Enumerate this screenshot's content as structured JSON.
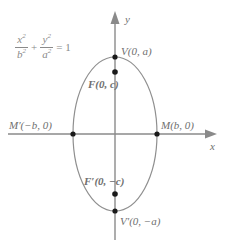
{
  "figure": {
    "colors": {
      "axis": "#8a8a8a",
      "curve": "#8f8f8f",
      "text": "#6f6f6f",
      "equation": "#8a8a8a",
      "point": "#1a1a1a",
      "background": "#ffffff"
    }
  },
  "equation": {
    "x_num": "x",
    "x_num_exp": "2",
    "x_den": "b",
    "x_den_exp": "2",
    "plus": "+",
    "y_num": "y",
    "y_num_exp": "2",
    "y_den": "a",
    "y_den_exp": "2",
    "equals": "= 1"
  },
  "axes": {
    "x_label": "x",
    "y_label": "y",
    "x_arrow": "arrow-right",
    "y_arrow": "arrow-up"
  },
  "points": [
    {
      "id": "vertex-top",
      "label": "V(0, a)",
      "bold": false,
      "x": 0,
      "y": 1,
      "px": 115,
      "py": 57
    },
    {
      "id": "focus-top",
      "label": "F(0, c)",
      "bold": true,
      "x": 0,
      "y": 0.6,
      "px": 115,
      "py": 72
    },
    {
      "id": "co-vertex-left",
      "label": "M'(-b, 0)",
      "bold": false,
      "x": -1,
      "y": 0,
      "px": 73,
      "py": 134
    },
    {
      "id": "co-vertex-right",
      "label": "M(b, 0)",
      "bold": false,
      "x": 1,
      "y": 0,
      "px": 157,
      "py": 134
    },
    {
      "id": "focus-bottom",
      "label": "F'(0, -c)",
      "bold": true,
      "x": 0,
      "y": -0.6,
      "px": 115,
      "py": 194
    },
    {
      "id": "vertex-bottom",
      "label": "V'(0, -a)",
      "bold": false,
      "x": 0,
      "y": -1,
      "px": 115,
      "py": 211
    }
  ],
  "labels": {
    "vertex_top": "V(0, a)",
    "focus_top": "F(0, c)",
    "co_vertex_left": "M′(−b, 0)",
    "co_vertex_right": "M(b, 0)",
    "focus_bottom": "F′(0, −c)",
    "vertex_bottom": "V′(0, −a)"
  },
  "geometry": {
    "center_x": 115,
    "center_y": 134,
    "semi_minor_b": 42,
    "semi_major_a": 77,
    "focus_offset_c": 62
  }
}
